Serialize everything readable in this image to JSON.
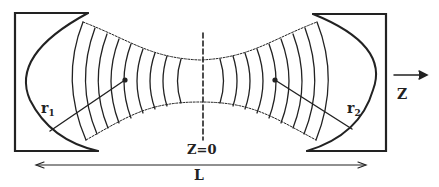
{
  "diagram": {
    "labels": {
      "r1": "r",
      "r1_sub": "1",
      "r2": "r",
      "r2_sub": "2",
      "z_axis": "Z",
      "waist": "Z=0",
      "length": "L"
    },
    "elements": {
      "left_mirror": "concave mirror (radius r1)",
      "right_mirror": "concave mirror (radius r2)",
      "beam": "gaussian beam with curved wavefronts",
      "center_line": "dashed line at beam waist",
      "length_arrow": "double-headed arrow spanning cavity length L",
      "z_arrow": "propagation direction arrow"
    },
    "colors": {
      "stroke": "#222222",
      "background": "#ffffff"
    }
  }
}
